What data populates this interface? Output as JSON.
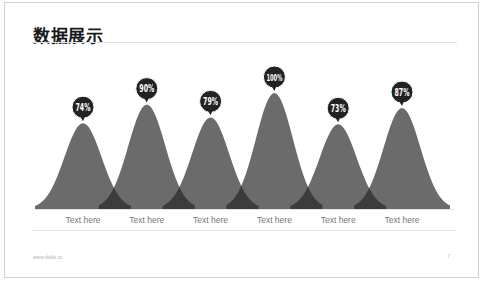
{
  "slide": {
    "title": "数据展示",
    "footer_url": "www.ddde.cc",
    "page_number": "7"
  },
  "chart_data": {
    "type": "area",
    "subtype": "bell-curve-peaks",
    "title": "数据展示",
    "categories": [
      "Text here",
      "Text here",
      "Text here",
      "Text here",
      "Text here",
      "Text here"
    ],
    "values": [
      74,
      90,
      79,
      100,
      73,
      87
    ],
    "value_labels": [
      "74%",
      "90%",
      "79%",
      "100%",
      "73%",
      "87%"
    ],
    "ylim": [
      0,
      100
    ],
    "grid": false,
    "legend": "none",
    "colors": {
      "curve_fill": "#6b6b6b",
      "overlap_fill": "#3c3c3c",
      "bubble_fill": "#222222",
      "bubble_text": "#ffffff"
    }
  }
}
